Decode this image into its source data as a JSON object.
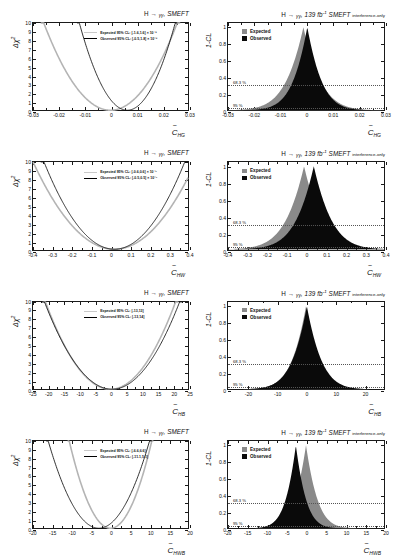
{
  "figure": {
    "n_rows": 4,
    "colors": {
      "expected": "#b4b4b4",
      "expected_fill": "#8a8a8a",
      "observed": "#0a0a0a",
      "axis": "#1a1a1a",
      "cl_line": "#555555"
    }
  },
  "chart_data": [
    {
      "id": "chi2-HG",
      "type": "line",
      "panel": "left",
      "row": 0,
      "title": "H → γγ, SMEFT",
      "xlabel": "C̃_HG",
      "xlabel_base": "C",
      "xlabel_sub": "HG",
      "ylabel": "Δχ²",
      "xlim": [
        -0.03,
        0.03
      ],
      "ylim": [
        0,
        10
      ],
      "xticks": [
        -0.03,
        -0.02,
        -0.01,
        0,
        0.01,
        0.02,
        0.03
      ],
      "xticklabels": [
        "-0.03",
        "-0.02",
        "-0.01",
        "0",
        "0.01",
        "0.02",
        "0.03"
      ],
      "yticks": [
        0,
        1,
        2,
        3,
        4,
        5,
        6,
        7,
        8,
        9,
        10
      ],
      "yticklabels": [
        "0",
        "1",
        "2",
        "3",
        "4",
        "5",
        "6",
        "7",
        "8",
        "9",
        "10"
      ],
      "legend": [
        {
          "name": "Expected 95% CL: [-1.6,1.6] × 10⁻²",
          "style": "expected"
        },
        {
          "name": "Observed 95% CL: [-0.5,1.8] × 10⁻²",
          "style": "observed"
        }
      ],
      "series": [
        {
          "name": "expected",
          "min": 0.0,
          "halfwidth_95": 0.016,
          "vertex_x": 0.0
        },
        {
          "name": "observed",
          "min": 0.0,
          "halfwidth_95": 0.0115,
          "vertex_x": 0.0065
        }
      ]
    },
    {
      "id": "cl-HG",
      "type": "area",
      "panel": "right",
      "row": 0,
      "title_main": "H → γγ, 139 fb⁻¹ SMEFT",
      "title_tail": "interference-only",
      "xlabel_base": "C",
      "xlabel_sub": "HG",
      "ylabel": "1-CL",
      "xlim": [
        -0.03,
        0.03
      ],
      "ylim": [
        0,
        1.05
      ],
      "xticks": [
        -0.03,
        -0.02,
        -0.01,
        0,
        0.01,
        0.02,
        0.03
      ],
      "xticklabels": [
        "-0.03",
        "-0.02",
        "-0.01",
        "0",
        "0.01",
        "0.02",
        "0.03"
      ],
      "yticks": [
        0,
        0.2,
        0.4,
        0.6,
        0.8,
        1
      ],
      "yticklabels": [
        "0",
        "0.2",
        "0.4",
        "0.6",
        "0.8",
        "1"
      ],
      "cl_lines": [
        {
          "label": "68.3 %",
          "value": 0.317
        },
        {
          "label": "95 %",
          "value": 0.05
        }
      ],
      "legend": [
        {
          "name": "Expected",
          "style": "expected"
        },
        {
          "name": "Observed",
          "style": "observed"
        }
      ],
      "series": [
        {
          "name": "expected",
          "peak_x": -0.001,
          "width": 0.0082
        },
        {
          "name": "observed",
          "peak_x": 0.0005,
          "width": 0.0068
        }
      ]
    },
    {
      "id": "chi2-HW",
      "type": "line",
      "panel": "left",
      "row": 1,
      "title": "H → γγ, SMEFT",
      "xlabel_base": "C",
      "xlabel_sub": "HW",
      "ylabel": "Δχ²",
      "xlim": [
        -0.4,
        0.4
      ],
      "ylim": [
        0,
        10
      ],
      "xticks": [
        -0.4,
        -0.3,
        -0.2,
        -0.1,
        0,
        0.1,
        0.2,
        0.3,
        0.4
      ],
      "xticklabels": [
        "-0.4",
        "-0.3",
        "-0.2",
        "-0.1",
        "0",
        "0.1",
        "0.2",
        "0.3",
        "0.4"
      ],
      "yticks": [
        0,
        1,
        2,
        3,
        4,
        5,
        6,
        7,
        8,
        9,
        10
      ],
      "yticklabels": [
        "0",
        "1",
        "2",
        "3",
        "4",
        "5",
        "6",
        "7",
        "8",
        "9",
        "10"
      ],
      "legend": [
        {
          "name": "Expected 95% CL: [-0.6,0.6] × 10⁻¹",
          "style": "expected"
        },
        {
          "name": "Observed 95% CL: [-0.5,0.5] × 10⁻¹",
          "style": "observed"
        }
      ],
      "series": [
        {
          "name": "expected",
          "min": 0.0,
          "halfwidth_95": 0.26,
          "vertex_x": 0.02
        },
        {
          "name": "observed",
          "min": 0.0,
          "halfwidth_95": 0.225,
          "vertex_x": 0.02
        }
      ]
    },
    {
      "id": "cl-HW",
      "type": "area",
      "panel": "right",
      "row": 1,
      "title_main": "H → γγ, 139 fb⁻¹ SMEFT",
      "title_tail": "interference-only",
      "xlabel_base": "C",
      "xlabel_sub": "HW",
      "ylabel": "1-CL",
      "xlim": [
        -0.4,
        0.4
      ],
      "ylim": [
        0,
        1.05
      ],
      "xticks": [
        -0.4,
        -0.3,
        -0.2,
        -0.1,
        0,
        0.1,
        0.2,
        0.3,
        0.4
      ],
      "xticklabels": [
        "-0.4",
        "-0.3",
        "-0.2",
        "-0.1",
        "0",
        "0.1",
        "0.2",
        "0.3",
        "0.4"
      ],
      "yticks": [
        0,
        0.2,
        0.4,
        0.6,
        0.8,
        1
      ],
      "yticklabels": [
        "0",
        "0.2",
        "0.4",
        "0.6",
        "0.8",
        "1"
      ],
      "cl_lines": [
        {
          "label": "68.3 %",
          "value": 0.317
        },
        {
          "label": "95 %",
          "value": 0.05
        }
      ],
      "legend": [
        {
          "name": "Expected",
          "style": "expected"
        },
        {
          "name": "Observed",
          "style": "observed"
        }
      ],
      "series": [
        {
          "name": "expected",
          "peak_x": -0.01,
          "width": 0.115
        },
        {
          "name": "observed",
          "peak_x": 0.04,
          "width": 0.112
        }
      ]
    },
    {
      "id": "chi2-HB",
      "type": "line",
      "panel": "left",
      "row": 2,
      "title": "H → γγ, SMEFT",
      "xlabel_base": "C",
      "xlabel_sub": "HB",
      "ylabel": "Δχ²",
      "xlim": [
        -25,
        25
      ],
      "ylim": [
        0,
        10
      ],
      "xticks": [
        -25,
        -20,
        -15,
        -10,
        -5,
        0,
        5,
        10,
        15,
        20,
        25
      ],
      "xticklabels": [
        "-25",
        "-20",
        "-15",
        "-10",
        "-5",
        "0",
        "5",
        "10",
        "15",
        "20",
        "25"
      ],
      "yticks": [
        0,
        1,
        2,
        3,
        4,
        5,
        6,
        7,
        8,
        9,
        10
      ],
      "yticklabels": [
        "0",
        "1",
        "2",
        "3",
        "4",
        "5",
        "6",
        "7",
        "8",
        "9",
        "10"
      ],
      "legend": [
        {
          "name": "Expected 95% CL: [-13,13]",
          "style": "expected"
        },
        {
          "name": "Observed 95% CL: [-13,14]",
          "style": "observed"
        }
      ],
      "series": [
        {
          "name": "expected",
          "min": 0.0,
          "halfwidth_95": 13.0,
          "vertex_x": 0.0
        },
        {
          "name": "observed",
          "min": 0.0,
          "halfwidth_95": 13.5,
          "vertex_x": 0.5
        }
      ]
    },
    {
      "id": "cl-HB",
      "type": "area",
      "panel": "right",
      "row": 2,
      "title_main": "H → γγ, 139 fb⁻¹ SMEFT",
      "title_tail": "interference-only",
      "xlabel_base": "C",
      "xlabel_sub": "HB",
      "ylabel": "1-CL",
      "xlim": [
        -27,
        27
      ],
      "ylim": [
        0,
        1.05
      ],
      "xticks": [
        -20,
        -10,
        0,
        10,
        20
      ],
      "xticklabels": [
        "-20",
        "-10",
        "0",
        "10",
        "20"
      ],
      "yticks": [
        0,
        0.2,
        0.4,
        0.6,
        0.8,
        1
      ],
      "yticklabels": [
        "0",
        "0.2",
        "0.4",
        "0.6",
        "0.8",
        "1"
      ],
      "cl_lines": [
        {
          "label": "68.3 %",
          "value": 0.317
        },
        {
          "label": "95 %",
          "value": 0.05
        }
      ],
      "legend": [
        {
          "name": "Expected",
          "style": "expected"
        },
        {
          "name": "Observed",
          "style": "observed"
        }
      ],
      "series": [
        {
          "name": "expected",
          "peak_x": 0.0,
          "width": 6.0
        },
        {
          "name": "observed",
          "peak_x": 0.3,
          "width": 6.2
        }
      ]
    },
    {
      "id": "chi2-HWB",
      "type": "line",
      "panel": "left",
      "row": 3,
      "title": "H → γγ, SMEFT",
      "xlabel_base": "C",
      "xlabel_sub": "HWB",
      "ylabel": "Δχ²",
      "xlim": [
        -20,
        20
      ],
      "ylim": [
        0,
        10
      ],
      "xticks": [
        -20,
        -15,
        -10,
        -5,
        0,
        5,
        10,
        15,
        20
      ],
      "xticklabels": [
        "-20",
        "-15",
        "-10",
        "-5",
        "0",
        "5",
        "10",
        "15",
        "20"
      ],
      "yticks": [
        0,
        1,
        2,
        3,
        4,
        5,
        6,
        7,
        8,
        9,
        10
      ],
      "yticklabels": [
        "0",
        "1",
        "2",
        "3",
        "4",
        "5",
        "6",
        "7",
        "8",
        "9",
        "10"
      ],
      "legend": [
        {
          "name": "Expected 95% CL: [-6.6,6.6]",
          "style": "expected"
        },
        {
          "name": "Observed 95% CL: [-11.1,5.1]",
          "style": "observed"
        }
      ],
      "series": [
        {
          "name": "expected",
          "min": 0.0,
          "halfwidth_95": 6.6,
          "vertex_x": 0.0
        },
        {
          "name": "observed",
          "min": 0.0,
          "halfwidth_95": 8.1,
          "vertex_x": -3.0
        }
      ]
    },
    {
      "id": "cl-HWB",
      "type": "area",
      "panel": "right",
      "row": 3,
      "title_main": "H → γγ, 139 fb⁻¹ SMEFT",
      "title_tail": "interference-only",
      "xlabel_base": "C",
      "xlabel_sub": "HWB",
      "ylabel": "1-CL",
      "xlim": [
        -20,
        20
      ],
      "ylim": [
        0,
        1.05
      ],
      "xticks": [
        -20,
        -15,
        -10,
        -5,
        0,
        5,
        10,
        15,
        20
      ],
      "xticklabels": [
        "-20",
        "-15",
        "-10",
        "-5",
        "0",
        "5",
        "10",
        "15",
        "20"
      ],
      "yticks": [
        0,
        0.2,
        0.4,
        0.6,
        0.8,
        1
      ],
      "yticklabels": [
        "0",
        "0.2",
        "0.4",
        "0.6",
        "0.8",
        "1"
      ],
      "cl_lines": [
        {
          "label": "68.3 %",
          "value": 0.317
        },
        {
          "label": "95 %",
          "value": 0.05
        }
      ],
      "legend": [
        {
          "name": "Expected",
          "style": "expected"
        },
        {
          "name": "Observed",
          "style": "observed"
        }
      ],
      "series": [
        {
          "name": "expected",
          "peak_x": 0.0,
          "width": 3.6
        },
        {
          "name": "observed",
          "peak_x": -2.6,
          "width": 3.2
        }
      ]
    }
  ]
}
